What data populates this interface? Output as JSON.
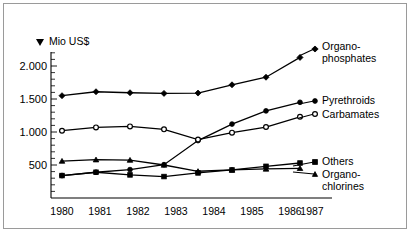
{
  "chart_data": {
    "type": "line",
    "title": "",
    "subtitle": "",
    "xlabel": "",
    "ylabel": "Mio US$",
    "ylabel_marker": "▼",
    "x": [
      "1980",
      "1981",
      "1982",
      "1983",
      "1984",
      "1985",
      "1986",
      "1987"
    ],
    "categories": [
      "1980",
      "1981",
      "1982",
      "1983",
      "1984",
      "1985",
      "1986",
      "1987"
    ],
    "ylim": [
      0,
      2300
    ],
    "xlim": [
      "1980",
      "1987"
    ],
    "ytick_labels": [
      "2.000",
      "1.500",
      "1.000",
      "500"
    ],
    "ytick_values": [
      2000,
      1500,
      1000,
      500
    ],
    "minor_tick_step": 100,
    "grid": false,
    "legend_position": "right-inline",
    "series": [
      {
        "name": "Organo-\nphosphates",
        "label_line1": "Organo-",
        "label_line2": "phosphates",
        "marker": "diamond",
        "marker_fill": "filled",
        "values": [
          1550,
          1610,
          1595,
          1585,
          1590,
          1715,
          1830,
          2130
        ]
      },
      {
        "name": "Pyrethroids",
        "label_line1": "Pyrethroids",
        "label_line2": "",
        "marker": "circle",
        "marker_fill": "filled",
        "values": [
          340,
          390,
          430,
          505,
          870,
          1120,
          1320,
          1450
        ]
      },
      {
        "name": "Carbamates",
        "label_line1": "Carbamates",
        "label_line2": "",
        "marker": "circle",
        "marker_fill": "open",
        "values": [
          1020,
          1070,
          1085,
          1040,
          885,
          990,
          1075,
          1230
        ]
      },
      {
        "name": "Others",
        "label_line1": "Others",
        "label_line2": "",
        "marker": "square",
        "marker_fill": "filled",
        "values": [
          340,
          390,
          350,
          325,
          380,
          425,
          480,
          530
        ]
      },
      {
        "name": "Organo-\nchlorines",
        "label_line1": "Organo-",
        "label_line2": "chlorines",
        "marker": "triangle",
        "marker_fill": "filled",
        "values": [
          560,
          580,
          575,
          500,
          405,
          425,
          440,
          450
        ]
      }
    ]
  },
  "legend": {
    "items": [
      {
        "label_line1": "Organo-",
        "label_line2": "phosphates",
        "marker": "diamond"
      },
      {
        "label_line1": "Pyrethroids",
        "label_line2": "",
        "marker": "circle-filled"
      },
      {
        "label_line1": "Carbamates",
        "label_line2": "",
        "marker": "circle-open"
      },
      {
        "label_line1": "Others",
        "label_line2": "",
        "marker": "square"
      },
      {
        "label_line1": "Organo-",
        "label_line2": "chlorines",
        "marker": "triangle"
      }
    ]
  }
}
